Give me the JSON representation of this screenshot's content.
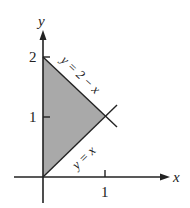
{
  "diagram": {
    "type": "region-plot",
    "axes": {
      "x_label": "x",
      "y_label": "y",
      "x_ticks": [
        {
          "value": 1,
          "label": "1"
        }
      ],
      "y_ticks": [
        {
          "value": 1,
          "label": "1"
        },
        {
          "value": 2,
          "label": "2"
        }
      ]
    },
    "curves": [
      {
        "name": "line-y-equals-2-minus-x",
        "label": "y = 2 − x"
      },
      {
        "name": "line-y-equals-x",
        "label": "y = x"
      }
    ],
    "region": {
      "description": "Shaded triangle bounded by x = 0, y = x, y = 2 − x",
      "vertices": [
        [
          0,
          0
        ],
        [
          0,
          2
        ],
        [
          1,
          1
        ]
      ],
      "fill_color": "#a9a9a9"
    },
    "colors": {
      "ink": "#222222",
      "shade": "#a9a9a9"
    }
  }
}
